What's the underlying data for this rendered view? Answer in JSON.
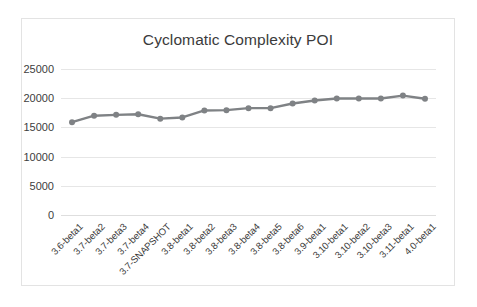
{
  "chart_data": {
    "type": "line",
    "title": "Cyclomatic Complexity POI",
    "xlabel": "",
    "ylabel": "",
    "ylim": [
      0,
      25000
    ],
    "ytick_labels": [
      "25000",
      "20000",
      "15000",
      "10000",
      "5000",
      "0"
    ],
    "ytick_values": [
      25000,
      20000,
      15000,
      10000,
      5000,
      0
    ],
    "grid": true,
    "legend": "none",
    "series_color": "#7f8285",
    "marker": "circle",
    "categories": [
      "3.6-beta1",
      "3.7-beta2",
      "3.7-beta3",
      "3.7-beta4",
      "3.7-SNAPSHOT",
      "3.8-beta1",
      "3.8-beta2",
      "3.8-beta3",
      "3.8-beta4",
      "3.8-beta5",
      "3.8-beta6",
      "3.9-beta1",
      "3.10-beta1",
      "3.10-beta2",
      "3.10-beta3",
      "3.11-beta1",
      "4.0-beta1"
    ],
    "values": [
      15900,
      17000,
      17150,
      17250,
      16500,
      16700,
      17900,
      17950,
      18300,
      18300,
      19100,
      19600,
      19950,
      19950,
      19950,
      20450,
      19900
    ]
  }
}
